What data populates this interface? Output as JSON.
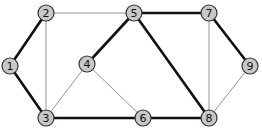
{
  "diagram": {
    "type": "graph",
    "nodes": [
      {
        "id": "1",
        "label": "1",
        "x": 10,
        "y": 66
      },
      {
        "id": "2",
        "label": "2",
        "x": 46,
        "y": 13
      },
      {
        "id": "3",
        "label": "3",
        "x": 46,
        "y": 118
      },
      {
        "id": "4",
        "label": "4",
        "x": 87,
        "y": 64
      },
      {
        "id": "5",
        "label": "5",
        "x": 134,
        "y": 13
      },
      {
        "id": "6",
        "label": "6",
        "x": 143,
        "y": 118
      },
      {
        "id": "7",
        "label": "7",
        "x": 209,
        "y": 13
      },
      {
        "id": "8",
        "label": "8",
        "x": 209,
        "y": 118
      },
      {
        "id": "9",
        "label": "9",
        "x": 250,
        "y": 66
      }
    ],
    "edges": [
      {
        "from": "1",
        "to": "2",
        "bold": true
      },
      {
        "from": "1",
        "to": "3",
        "bold": true
      },
      {
        "from": "2",
        "to": "3",
        "bold": false
      },
      {
        "from": "2",
        "to": "5",
        "bold": false
      },
      {
        "from": "3",
        "to": "4",
        "bold": false
      },
      {
        "from": "3",
        "to": "6",
        "bold": true
      },
      {
        "from": "4",
        "to": "5",
        "bold": true
      },
      {
        "from": "4",
        "to": "6",
        "bold": false
      },
      {
        "from": "5",
        "to": "7",
        "bold": true
      },
      {
        "from": "5",
        "to": "8",
        "bold": true
      },
      {
        "from": "6",
        "to": "8",
        "bold": true
      },
      {
        "from": "7",
        "to": "8",
        "bold": false
      },
      {
        "from": "7",
        "to": "9",
        "bold": true
      },
      {
        "from": "8",
        "to": "9",
        "bold": false
      }
    ],
    "colors": {
      "node_fill": "#c8c8c8",
      "node_stroke": "#333333",
      "bold_edge": "#111111",
      "thin_edge": "#888888"
    }
  }
}
